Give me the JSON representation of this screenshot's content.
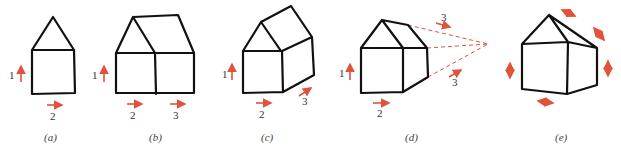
{
  "figure": {
    "panels": [
      {
        "id": "a",
        "caption": "(a)",
        "labels": {
          "vertical": "1",
          "horizontal": "2"
        }
      },
      {
        "id": "b",
        "caption": "(b)",
        "labels": {
          "vertical": "1",
          "horizontal_left": "2",
          "horizontal_right": "3"
        }
      },
      {
        "id": "c",
        "caption": "(c)",
        "labels": {
          "vertical": "1",
          "horizontal": "2",
          "depth": "3"
        }
      },
      {
        "id": "d",
        "caption": "(d)",
        "labels": {
          "vertical": "1",
          "horizontal": "2",
          "depth_top": "3",
          "depth_bottom": "3"
        }
      },
      {
        "id": "e",
        "caption": "(e)"
      }
    ],
    "accent_color": "#e0533a",
    "line_color": "#111111"
  }
}
